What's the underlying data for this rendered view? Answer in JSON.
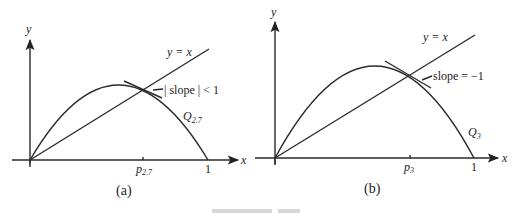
{
  "figure": {
    "panels": [
      {
        "id": "a",
        "caption": "(a)",
        "axis_x_label": "x",
        "axis_y_label": "y",
        "line_label": "y = x",
        "annotation": "| slope | < 1",
        "curve_label_main": "Q",
        "curve_label_sub": "2.7",
        "fixed_point_label_main": "p",
        "fixed_point_label_sub": "2.7",
        "x_end_tick": "1"
      },
      {
        "id": "b",
        "caption": "(b)",
        "axis_x_label": "x",
        "axis_y_label": "y",
        "line_label": "y = x",
        "annotation": "slope = −1",
        "curve_label_main": "Q",
        "curve_label_sub": "3",
        "fixed_point_label_main": "p",
        "fixed_point_label_sub": "3",
        "x_end_tick": "1"
      }
    ]
  }
}
